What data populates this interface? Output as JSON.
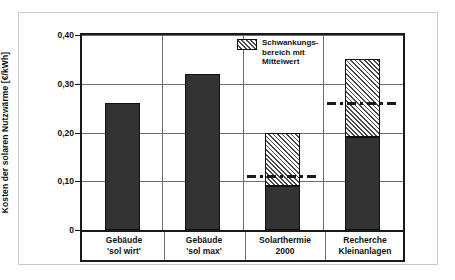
{
  "chart_data": {
    "type": "bar",
    "title": "",
    "xlabel": "",
    "ylabel": "Kosten der solaren Nutzwärme [€/kWh]",
    "ylim": [
      0,
      0.4
    ],
    "yticks": [
      0,
      0.1,
      0.2,
      0.3,
      0.4
    ],
    "ytick_labels": [
      "0",
      "0,10",
      "0,20",
      "0,30",
      "0,40"
    ],
    "grid": true,
    "legend_position": "top-center",
    "categories": [
      "Gebäude\n'sol wirt'",
      "Gebäude\n'sol max'",
      "Solarthermie\n2000",
      "Recherche\nKleinanlagen"
    ],
    "bars": [
      {
        "category": "Gebäude 'sol wirt'",
        "label_line1": "Gebäude",
        "label_line2": "'sol wirt'",
        "solid_top": 0.26,
        "range_low": null,
        "range_high": null,
        "mean": null
      },
      {
        "category": "Gebäude 'sol max'",
        "label_line1": "Gebäude",
        "label_line2": "'sol max'",
        "solid_top": 0.32,
        "range_low": null,
        "range_high": null,
        "mean": null
      },
      {
        "category": "Solarthermie 2000",
        "label_line1": "Solarthermie",
        "label_line2": "2000",
        "solid_top": 0.09,
        "range_low": 0.09,
        "range_high": 0.2,
        "mean": 0.11
      },
      {
        "category": "Recherche Kleinanlagen",
        "label_line1": "Recherche",
        "label_line2": "Kleinanlagen",
        "solid_top": 0.19,
        "range_low": 0.19,
        "range_high": 0.35,
        "mean": 0.26
      }
    ],
    "legend": [
      {
        "swatch": "hatched",
        "text": "Schwankungs-\nbereich mit\nMittelwert"
      }
    ],
    "colors": {
      "bar_solid": "#333333",
      "bar_outline": "#111111",
      "hatch": "#4a4a4a",
      "gridline": "#6e6e6e",
      "axis": "#1a1a1a",
      "frame": "#c8c8c8",
      "background": "#ffffff"
    }
  }
}
